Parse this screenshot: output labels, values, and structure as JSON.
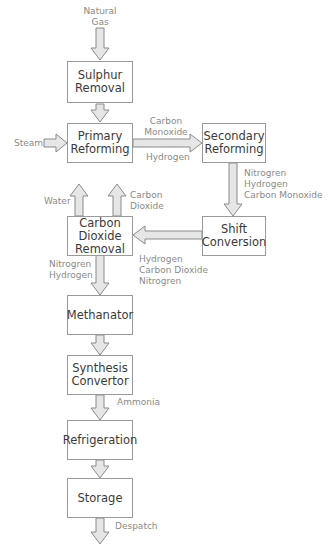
{
  "diagram": {
    "type": "process-flowchart",
    "colors": {
      "box_border": "#9a9a9a",
      "box_text": "#3a3a3a",
      "label_text": "#8a8a8a",
      "arrow_stroke": "#8a8a8a",
      "arrow_fill": "#e6e6e6"
    },
    "boxes": {
      "sulphur_removal": "Sulphur\nRemoval",
      "primary_reforming": "Primary\nReforming",
      "secondary_reforming": "Secondary\nReforming",
      "shift_conversion": "Shift\nConversion",
      "carbon_dioxide_removal": "Carbon\nDioxide\nRemoval",
      "methanator": "Methanator",
      "synthesis_convertor": "Synthesis\nConvertor",
      "refrigeration": "Refrigeration",
      "storage": "Storage"
    },
    "labels": {
      "natural_gas": "Natural\nGas",
      "steam": "Steam",
      "carbon_monoxide": "Carbon\nMonoxide",
      "hydrogen": "Hydrogen",
      "secondary_to_shift": "Nitrogren\nHydrogen\nCarbon Monoxide",
      "water": "Water",
      "carbon_dioxide": "Carbon\nDioxide",
      "shift_to_co2": "Hydrogen\nCarbon Dioxide\nNitrogren",
      "co2_to_methanator": "Nitrogren\nHydrogen",
      "ammonia": "Ammonia",
      "despatch": "Despatch"
    }
  }
}
